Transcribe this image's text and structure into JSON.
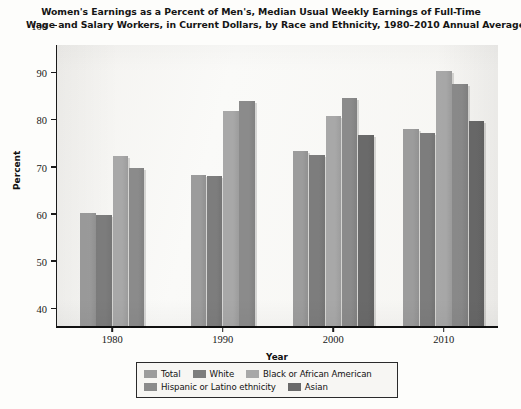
{
  "chart_data": {
    "type": "bar",
    "title": "Women's Earnings as a Percent of Men's, Median Usual Weekly Earnings of Full-Time Wage and Salary Workers, in Current Dollars, by Race and Ethnicity, 1980–2010 Annual Averages",
    "title_line1": "Women's Earnings as a Percent of Men's, Median Usual Weekly Earnings of Full-Time",
    "title_line2": "Wage and Salary Workers, in Current Dollars, by Race and Ethnicity, 1980–2010 Annual Averages",
    "xlabel": "Year",
    "ylabel": "Percent",
    "ylim": [
      40,
      100
    ],
    "ytick_step": 10,
    "yticks": [
      "100",
      "90",
      "80",
      "70",
      "60",
      "50",
      "40"
    ],
    "categories": [
      "1980",
      "1990",
      "2000",
      "2010"
    ],
    "grid": false,
    "legend_position": "bottom",
    "series": [
      {
        "name": "Total",
        "color": "#9c9c9c",
        "values": [
          64.0,
          72.0,
          77.2,
          81.8
        ]
      },
      {
        "name": "White",
        "color": "#7d7d7d",
        "values": [
          63.6,
          71.8,
          76.2,
          81.0
        ]
      },
      {
        "name": "Black or African American",
        "color": "#a8a8a8",
        "values": [
          76.0,
          85.6,
          84.6,
          94.1
        ]
      },
      {
        "name": "Hispanic or Latino ethnicity",
        "color": "#8b8b8b",
        "values": [
          73.5,
          87.7,
          88.3,
          91.3
        ]
      },
      {
        "name": "Asian",
        "color": "#6a6a6a",
        "values": [
          null,
          null,
          80.4,
          83.4
        ]
      }
    ]
  },
  "legend": {
    "row1": [
      "Total",
      "White",
      "Black or African American"
    ],
    "row2": [
      "Hispanic or Latino ethnicity",
      "Asian"
    ]
  }
}
